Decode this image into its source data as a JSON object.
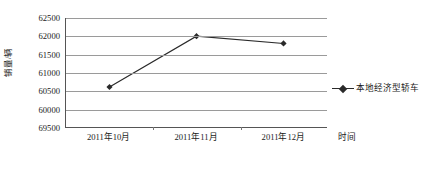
{
  "chart_data": {
    "type": "line",
    "title": "",
    "xlabel": "时间",
    "ylabel": "销量/辆",
    "categories": [
      "2011年10月",
      "2011年11月",
      "2011年12月"
    ],
    "series": [
      {
        "name": "本地经济型轿车",
        "values": [
          60600,
          62000,
          61800
        ],
        "color": "#2a2a2a",
        "marker": "diamond"
      }
    ],
    "ylim": [
      59500,
      62500
    ],
    "ytick_labels": [
      "62500",
      "62000",
      "61500",
      "61000",
      "60500",
      "60000",
      "69500"
    ],
    "ytick_values": [
      62500,
      62000,
      61500,
      61000,
      60500,
      60000,
      59500
    ],
    "grid": "horizontal",
    "legend_position": "right",
    "annotations": []
  },
  "legend": {
    "entries": [
      {
        "label": "本地经济型轿车",
        "marker_icon": "diamond-marker-icon"
      }
    ]
  },
  "axes": {
    "y_title": "销量/辆",
    "x_title": "时间"
  }
}
